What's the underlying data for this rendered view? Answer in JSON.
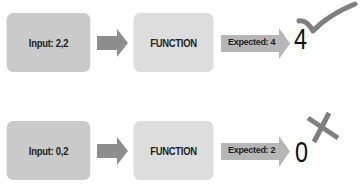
{
  "colors": {
    "input_box": "#cacaca",
    "function_box": "#dddddd",
    "input_arrow": "#8e8e8e",
    "expected_arrow": "#b6b6b6",
    "mark": "#7f7f7f",
    "text": "#1e1e1e"
  },
  "rows": [
    {
      "input_label": "Input: 2,2",
      "function_label": "FUNCTION",
      "expected_label": "Expected: 4",
      "result": "4",
      "status": "check-icon",
      "passed": true
    },
    {
      "input_label": "Input: 0,2",
      "function_label": "FUNCTION",
      "expected_label": "Expected: 2",
      "result": "0",
      "status": "cross-icon",
      "passed": false
    }
  ]
}
